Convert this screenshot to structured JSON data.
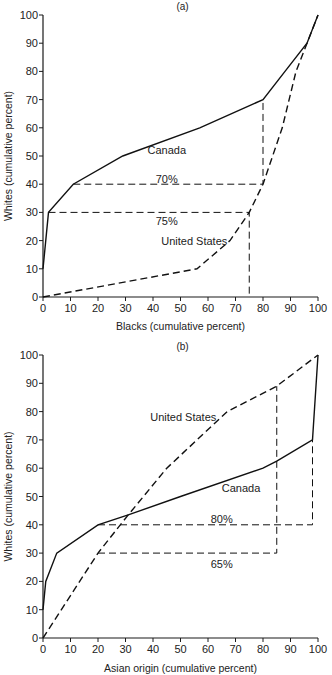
{
  "chart_data": [
    {
      "type": "line",
      "panel_label": "(a)",
      "xlabel": "Blacks (cumulative percent)",
      "ylabel": "Whites (cumulative percent)",
      "xlim": [
        0,
        100
      ],
      "ylim": [
        0,
        100
      ],
      "xticks": [
        0,
        10,
        20,
        30,
        40,
        50,
        60,
        70,
        80,
        90,
        100
      ],
      "yticks": [
        0,
        10,
        20,
        30,
        40,
        50,
        60,
        70,
        80,
        90,
        100
      ],
      "grid": false,
      "series": [
        {
          "name": "Canada",
          "style": "solid",
          "points": [
            [
              0,
              10
            ],
            [
              2,
              30
            ],
            [
              11,
              40
            ],
            [
              29,
              50
            ],
            [
              57,
              60
            ],
            [
              80,
              70
            ],
            [
              88,
              80
            ],
            [
              96,
              90
            ],
            [
              100,
              100
            ]
          ]
        },
        {
          "name": "United States",
          "style": "dashed",
          "points": [
            [
              0,
              0
            ],
            [
              56,
              10
            ],
            [
              68,
              20
            ],
            [
              75,
              30
            ],
            [
              80,
              40
            ],
            [
              87,
              60
            ],
            [
              92,
              80
            ],
            [
              100,
              100
            ]
          ]
        }
      ],
      "guides": [
        {
          "label": "70%",
          "points": [
            [
              11,
              40
            ],
            [
              80,
              40
            ],
            [
              80,
              70
            ]
          ]
        },
        {
          "label": "75%",
          "points": [
            [
              2,
              30
            ],
            [
              75,
              30
            ],
            [
              75,
              0
            ]
          ]
        }
      ],
      "annotations": [
        {
          "text": "Canada",
          "x": 45,
          "y": 52
        },
        {
          "text": "United States",
          "x": 55,
          "y": 20
        },
        {
          "text": "70%",
          "x": 45,
          "y": 42
        },
        {
          "text": "75%",
          "x": 45,
          "y": 27
        }
      ]
    },
    {
      "type": "line",
      "panel_label": "(b)",
      "xlabel": "Asian origin (cumulative percent)",
      "ylabel": "Whites (cumulative percent)",
      "xlim": [
        0,
        100
      ],
      "ylim": [
        0,
        100
      ],
      "xticks": [
        0,
        10,
        20,
        30,
        40,
        50,
        60,
        70,
        80,
        90,
        100
      ],
      "yticks": [
        0,
        10,
        20,
        30,
        40,
        50,
        60,
        70,
        80,
        90,
        100
      ],
      "grid": false,
      "series": [
        {
          "name": "Canada",
          "style": "solid",
          "points": [
            [
              0,
              10
            ],
            [
              1,
              20
            ],
            [
              5,
              30
            ],
            [
              20,
              40
            ],
            [
              31,
              43.5
            ],
            [
              50,
              50
            ],
            [
              80,
              60
            ],
            [
              85,
              62.5
            ],
            [
              98,
              70
            ],
            [
              100,
              100
            ]
          ]
        },
        {
          "name": "United States",
          "style": "dashed",
          "points": [
            [
              0,
              0
            ],
            [
              10,
              15
            ],
            [
              20,
              30
            ],
            [
              31,
              43.5
            ],
            [
              45,
              60
            ],
            [
              67,
              80
            ],
            [
              85,
              89
            ],
            [
              100,
              100
            ]
          ]
        }
      ],
      "guides": [
        {
          "label": "80%",
          "points": [
            [
              20,
              40
            ],
            [
              98,
              40
            ],
            [
              98,
              70
            ]
          ]
        },
        {
          "label": "65%",
          "points": [
            [
              20,
              30
            ],
            [
              85,
              30
            ],
            [
              85,
              89
            ]
          ]
        }
      ],
      "annotations": [
        {
          "text": "United States",
          "x": 51,
          "y": 78
        },
        {
          "text": "Canada",
          "x": 72,
          "y": 53
        },
        {
          "text": "80%",
          "x": 65,
          "y": 42
        },
        {
          "text": "65%",
          "x": 65,
          "y": 26
        }
      ]
    }
  ]
}
